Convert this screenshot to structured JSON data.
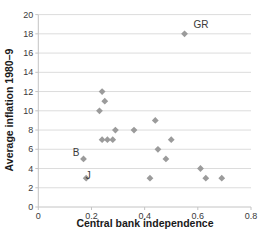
{
  "chart_data": {
    "type": "scatter",
    "title": "",
    "xlabel": "Central bank independence",
    "ylabel": "Average inflation 1980–9",
    "xlim": [
      0,
      0.8
    ],
    "ylim": [
      0,
      20
    ],
    "xticks": [
      0,
      0.2,
      0.4,
      0.6,
      0.8
    ],
    "xtick_labels": [
      "0",
      "0.2",
      "0.4",
      "0.6",
      "0.8"
    ],
    "yticks": [
      0,
      2,
      4,
      6,
      8,
      10,
      12,
      14,
      16,
      18,
      20
    ],
    "ytick_labels": [
      "0",
      "2",
      "4",
      "6",
      "8",
      "10",
      "12",
      "14",
      "16",
      "18",
      "20"
    ],
    "grid": "horizontal",
    "legend": "none",
    "marker": "diamond",
    "marker_color": "#9b9b9b",
    "grid_color": "#dcdcdc",
    "axis_color": "#c4c4c4",
    "text_color": "#3a3a3a",
    "points": [
      {
        "x": 0.55,
        "y": 18,
        "label": "GR",
        "label_dx": 9,
        "label_dy": -6,
        "label_anchor": "start"
      },
      {
        "x": 0.24,
        "y": 12
      },
      {
        "x": 0.25,
        "y": 11
      },
      {
        "x": 0.23,
        "y": 10
      },
      {
        "x": 0.44,
        "y": 9
      },
      {
        "x": 0.29,
        "y": 8
      },
      {
        "x": 0.36,
        "y": 8
      },
      {
        "x": 0.24,
        "y": 7
      },
      {
        "x": 0.26,
        "y": 7
      },
      {
        "x": 0.28,
        "y": 7
      },
      {
        "x": 0.5,
        "y": 7
      },
      {
        "x": 0.45,
        "y": 6
      },
      {
        "x": 0.17,
        "y": 5,
        "label": "B",
        "label_dx": -4,
        "label_dy": -3,
        "label_anchor": "end"
      },
      {
        "x": 0.48,
        "y": 5
      },
      {
        "x": 0.61,
        "y": 4
      },
      {
        "x": 0.18,
        "y": 3,
        "label": "J",
        "label_dx": 2,
        "label_dy": 1,
        "label_anchor": "middle"
      },
      {
        "x": 0.42,
        "y": 3
      },
      {
        "x": 0.63,
        "y": 3
      },
      {
        "x": 0.69,
        "y": 3
      }
    ]
  }
}
